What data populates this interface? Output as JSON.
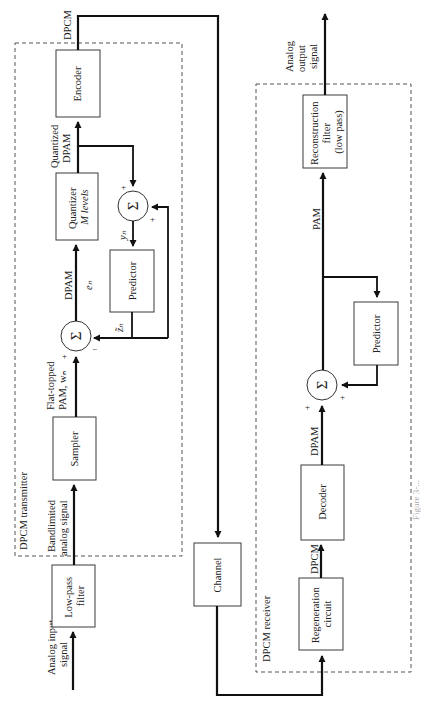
{
  "diagram": {
    "orientation": "rotated 90 degrees counter-clockwise",
    "transmitter": {
      "label": "DPCM transmitter",
      "blocks": {
        "lowpass": [
          "Low-pass",
          "filter"
        ],
        "sampler": "Sampler",
        "quantizer": [
          "Quantizer",
          "M levels"
        ],
        "encoder": "Encoder",
        "predictor": "Predictor",
        "sum_main": "Σ",
        "sum_feedback": "Σ"
      },
      "signals": {
        "input": [
          "Analog input",
          "signal"
        ],
        "bandlimited": [
          "Bandlimited",
          "analog signal"
        ],
        "flat_pam": [
          "Flat-topped",
          "PAM, wₙ"
        ],
        "dpam": "DPAM",
        "en": "eₙ",
        "quantized": [
          "Quantized",
          "DPAM"
        ],
        "yn": "yₙ",
        "zn": "z̃ₙ",
        "output": "DPCM"
      },
      "signs": {
        "main_plus": "+",
        "main_minus": "−",
        "fb_plus_top": "+",
        "fb_plus_right": "+"
      }
    },
    "channel": {
      "label": "Channel"
    },
    "receiver": {
      "label": "DPCM receiver",
      "blocks": {
        "regeneration": [
          "Regeneration",
          "circuit"
        ],
        "decoder": "Decoder",
        "sum": "Σ",
        "predictor": "Predictor",
        "reconstruction": [
          "Reconstruction",
          "filter",
          "(low pass)"
        ]
      },
      "signals": {
        "dpcm": "DPCM",
        "dpam": "DPAM",
        "pam": "PAM",
        "output": [
          "Analog",
          "output",
          "signal"
        ]
      },
      "signs": {
        "plus_left": "+",
        "plus_right": "+"
      }
    },
    "caption_fragment": "Figure 3-..."
  }
}
